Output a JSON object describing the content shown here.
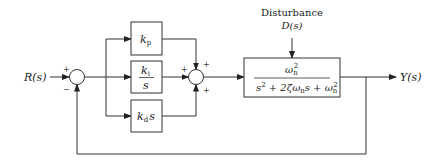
{
  "diagram": {
    "type": "block_diagram",
    "input": {
      "label": "R(s)"
    },
    "output": {
      "label": "Y(s)"
    },
    "disturbance": {
      "label": "Disturbance",
      "signal": "D(s)"
    },
    "junction1": {
      "signs": {
        "input": "+",
        "feedback": "−"
      }
    },
    "junction2": {
      "signs": {
        "top": "+",
        "left": "+",
        "bottom": "+"
      }
    },
    "controller_blocks": [
      {
        "id": "kp",
        "main": "k",
        "sub": "p",
        "suffix": ""
      },
      {
        "id": "ki",
        "num_main": "k",
        "num_sub": "i",
        "den": "s"
      },
      {
        "id": "kd",
        "main": "k",
        "sub": "d",
        "suffix": "s"
      }
    ],
    "plant": {
      "numerator": {
        "main": "ω",
        "sub": "n",
        "sup": "2"
      },
      "denominator": "s² + 2ζωₙs + ωₙ²",
      "den_parts": {
        "s2": "s",
        "s2_sup": "2",
        "plus1": " + 2ζω",
        "wn_sub": "n",
        "mid": "s + ω",
        "wn2_sub": "n",
        "wn2_sup": "2"
      }
    },
    "feedback": "unity negative feedback"
  }
}
